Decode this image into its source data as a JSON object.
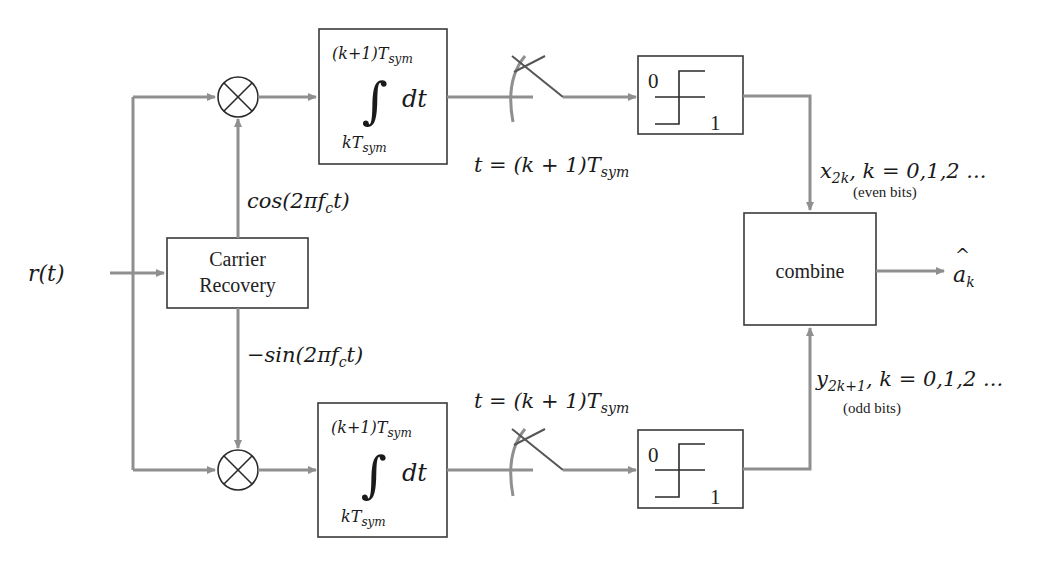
{
  "diagram": {
    "input": {
      "label": "r(t)"
    },
    "carrier_recovery": {
      "line1": "Carrier",
      "line2": "Recovery"
    },
    "oscillators": {
      "inphase": {
        "fn": "cos(2πf",
        "sub": "c",
        "tail": "t)"
      },
      "quadrature": {
        "fn": "−sin(2πf",
        "sub": "c",
        "tail": "t)"
      }
    },
    "integrator": {
      "upper_limit": "(k+1)T",
      "upper_sub": "sym",
      "lower_limit": "kT",
      "lower_sub": "sym",
      "symbol": "∫",
      "differential": "dt"
    },
    "sampler": {
      "label_main": "t = (k + 1)T",
      "label_sub": "sym"
    },
    "decision": {
      "top": "0",
      "bottom": "1"
    },
    "branches": {
      "even": {
        "var": "x",
        "sub": "2k",
        "rest": ", k = 0,1,2 ...",
        "note": "(even bits)"
      },
      "odd": {
        "var": "y",
        "sub": "2k+1",
        "rest": ", k = 0,1,2 ...",
        "note": "(odd bits)"
      }
    },
    "combiner": {
      "label": "combine"
    },
    "output": {
      "hat": "^",
      "var": "a",
      "sub": "k"
    },
    "colors": {
      "wire": "#8f8f8f",
      "box": "#3a3a3a",
      "text": "#1a1a1a"
    }
  }
}
